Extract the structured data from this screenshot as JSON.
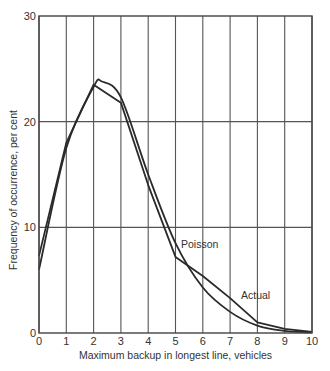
{
  "chart_data": {
    "type": "line",
    "title": "",
    "xlabel": "Maximum backup in longest line, vehicles",
    "ylabel": "Frequency of occurrence, per cent",
    "xlim": [
      0,
      10
    ],
    "ylim": [
      0,
      30
    ],
    "x_ticks": [
      "0",
      "1",
      "2",
      "3",
      "4",
      "5",
      "6",
      "7",
      "8",
      "9",
      "10"
    ],
    "y_ticks": [
      "0",
      "10",
      "20",
      "30"
    ],
    "grid": {
      "vertical": true,
      "horizontal": [
        10,
        20
      ]
    },
    "legend": null,
    "annotations": [
      {
        "text": "Poisson",
        "x": 5.2,
        "y": 8.0
      },
      {
        "text": "Actual",
        "x": 7.4,
        "y": 3.2
      }
    ],
    "series": [
      {
        "name": "Actual",
        "style": "polyline",
        "x": [
          0,
          1,
          2,
          3,
          4,
          5,
          6,
          7,
          8,
          9,
          10
        ],
        "values": [
          7.3,
          18.0,
          23.5,
          21.8,
          14.0,
          7.2,
          5.4,
          3.3,
          1.0,
          0.4,
          0.1
        ]
      },
      {
        "name": "Poisson",
        "style": "smooth",
        "x": [
          0,
          1,
          2,
          2.3,
          3,
          4,
          5,
          6,
          7,
          8,
          9,
          10
        ],
        "values": [
          6.0,
          17.5,
          23.3,
          23.8,
          22.3,
          15.0,
          8.5,
          4.3,
          2.0,
          0.7,
          0.2,
          0.05
        ]
      }
    ]
  }
}
